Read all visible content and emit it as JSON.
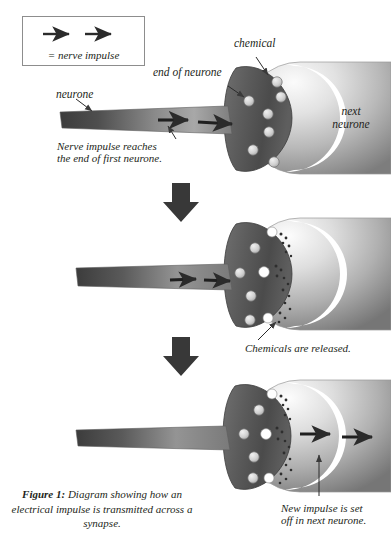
{
  "figure": {
    "caption_bold": "Figure 1:",
    "caption_rest": " Diagram showing how an electrical impulse is transmitted across a synapse."
  },
  "legend": {
    "text": "= nerve impulse",
    "arrow_count": 2,
    "icon": "right-arrow-icon"
  },
  "colors": {
    "ink": "#231f20",
    "arrow_dark": "#2b2b2b",
    "bulb_dark": "#4a4a4a",
    "bulb_light": "#8e8e8e",
    "sphere_light": "#f2f2f2",
    "sphere_dark": "#8c8c8c",
    "cleft_white": "#ffffff",
    "vesicle": "#d7d7d7",
    "outline": "#6b6b6b",
    "box_border": "#8d8d8d"
  },
  "panels": [
    {
      "id": "panel-top",
      "stage": 1,
      "labels": [
        {
          "name": "label-neurone",
          "text": "neurone"
        },
        {
          "name": "label-end-of-neurone",
          "text": "end of neurone"
        },
        {
          "name": "label-chemical",
          "text": "chemical"
        },
        {
          "name": "label-next-neurone",
          "text": "next\nneurone"
        },
        {
          "name": "label-impulse-reaches",
          "text": "Nerve impulse reaches\nthe end of first neurone."
        }
      ],
      "next_neurone_line1": "next",
      "next_neurone_line2": "neurone",
      "note_line1": "Nerve impulse reaches",
      "note_line2": "the end of first neurone.",
      "impulse_arrows": 2,
      "vesicles": 7,
      "released": false
    },
    {
      "id": "panel-middle",
      "stage": 2,
      "note": "Chemicals are released.",
      "impulse_arrows": 2,
      "vesicles": 4,
      "released": true
    },
    {
      "id": "panel-bottom",
      "stage": 3,
      "note_line1": "New impulse is set",
      "note_line2": "off in next neurone.",
      "impulse_arrows": 2,
      "vesicles": 4,
      "released": true
    }
  ],
  "flow_arrows": {
    "count": 2,
    "icon": "down-arrow-icon",
    "label": "next stage"
  }
}
